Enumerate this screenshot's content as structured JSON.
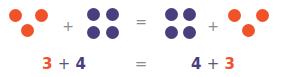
{
  "colors": {
    "orange": "#f0522a",
    "purple": "#4a3f7e",
    "symbol": "#8a8a92"
  },
  "top_row": {
    "groups": [
      {
        "name": "group-3-left",
        "color": "orange",
        "count": 3
      },
      {
        "name": "group-4-left",
        "color": "purple",
        "count": 4
      },
      {
        "name": "group-4-right",
        "color": "purple",
        "count": 4
      },
      {
        "name": "group-3-right",
        "color": "orange",
        "count": 3
      }
    ],
    "plus_1": "+",
    "equals": "=",
    "plus_2": "+"
  },
  "bottom_row": {
    "left": {
      "a": "3",
      "op": "+",
      "b": "4"
    },
    "equals": "=",
    "right": {
      "a": "4",
      "op": "+",
      "b": "3"
    }
  }
}
